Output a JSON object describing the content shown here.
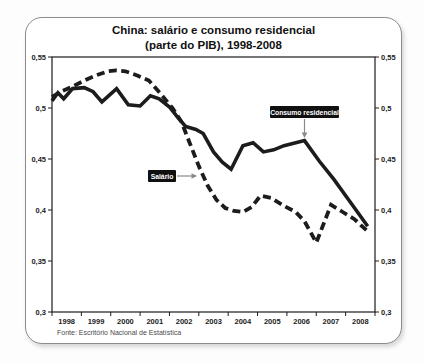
{
  "title": {
    "line1": "China: salário e consumo residencial",
    "line2": "(parte do PIB), 1998-2008"
  },
  "source": "Fonte: Escritório Nacional de Estatística",
  "colors": {
    "line": "#1c1c1c",
    "axis": "#1c1c1c",
    "annotation_bg": "#101010",
    "annotation_text": "#ffffff",
    "arrow": "#8a8a8a",
    "frame_border": "#8c8c8c",
    "background": "#ffffff"
  },
  "chart_data": {
    "type": "line",
    "title": "China: salário e consumo residencial (parte do PIB), 1998-2008",
    "xlabel": "",
    "ylabel": "",
    "x_range": [
      1998,
      2009
    ],
    "y_range": [
      0.3,
      0.55
    ],
    "grid": false,
    "legend_position": "inline-annotation-boxes",
    "y_ticks": [
      0.55,
      0.5,
      0.45,
      0.4,
      0.35,
      0.3
    ],
    "y_tick_labels": [
      "0,55",
      "0,5",
      "0,45",
      "0,4",
      "0,35",
      "0,3"
    ],
    "x_tick_labels": [
      "1998",
      "1999",
      "2000",
      "2001",
      "2002",
      "2003",
      "2004",
      "2005",
      "2006",
      "2007",
      "2008"
    ],
    "series": [
      {
        "name": "Consumo residencial",
        "style": "solid",
        "points": [
          [
            1998.0,
            0.507
          ],
          [
            1998.2,
            0.515
          ],
          [
            1998.4,
            0.509
          ],
          [
            1998.7,
            0.519
          ],
          [
            1999.1,
            0.52
          ],
          [
            1999.4,
            0.516
          ],
          [
            1999.7,
            0.506
          ],
          [
            2000.2,
            0.519
          ],
          [
            2000.6,
            0.503
          ],
          [
            2001.0,
            0.502
          ],
          [
            2001.35,
            0.512
          ],
          [
            2001.65,
            0.509
          ],
          [
            2002.0,
            0.501
          ],
          [
            2002.3,
            0.49
          ],
          [
            2002.55,
            0.482
          ],
          [
            2002.9,
            0.479
          ],
          [
            2003.15,
            0.475
          ],
          [
            2003.5,
            0.457
          ],
          [
            2003.8,
            0.447
          ],
          [
            2004.1,
            0.44
          ],
          [
            2004.5,
            0.463
          ],
          [
            2004.85,
            0.466
          ],
          [
            2005.2,
            0.457
          ],
          [
            2005.55,
            0.459
          ],
          [
            2005.9,
            0.463
          ],
          [
            2006.6,
            0.468
          ],
          [
            2007.1,
            0.448
          ],
          [
            2007.6,
            0.43
          ],
          [
            2008.1,
            0.41
          ],
          [
            2008.75,
            0.384
          ]
        ]
      },
      {
        "name": "Salário",
        "style": "dashed",
        "points": [
          [
            1998.0,
            0.511
          ],
          [
            1998.3,
            0.516
          ],
          [
            1998.7,
            0.521
          ],
          [
            1999.1,
            0.527
          ],
          [
            1999.5,
            0.532
          ],
          [
            1999.9,
            0.536
          ],
          [
            2000.2,
            0.537
          ],
          [
            2000.5,
            0.536
          ],
          [
            2000.9,
            0.532
          ],
          [
            2001.3,
            0.527
          ],
          [
            2001.7,
            0.514
          ],
          [
            2002.1,
            0.5
          ],
          [
            2002.4,
            0.487
          ],
          [
            2002.7,
            0.465
          ],
          [
            2003.0,
            0.443
          ],
          [
            2003.3,
            0.424
          ],
          [
            2003.6,
            0.41
          ],
          [
            2003.9,
            0.402
          ],
          [
            2004.2,
            0.399
          ],
          [
            2004.5,
            0.398
          ],
          [
            2004.8,
            0.403
          ],
          [
            2005.1,
            0.414
          ],
          [
            2005.45,
            0.412
          ],
          [
            2005.9,
            0.404
          ],
          [
            2006.3,
            0.398
          ],
          [
            2006.6,
            0.389
          ],
          [
            2007.0,
            0.368
          ],
          [
            2007.5,
            0.405
          ],
          [
            2007.9,
            0.398
          ],
          [
            2008.3,
            0.391
          ],
          [
            2008.75,
            0.379
          ]
        ]
      }
    ],
    "annotations": [
      {
        "text": "Consumo residencial",
        "box_px": {
          "x": 270,
          "y": 106,
          "w": 69,
          "h": 12
        },
        "arrow": {
          "x1": 304.5,
          "y1": 119,
          "x2": 304.5,
          "y2": 137,
          "dir": "down"
        }
      },
      {
        "text": "Salário",
        "box_px": {
          "x": 148,
          "y": 170,
          "w": 28,
          "h": 12
        },
        "arrow": {
          "x1": 177,
          "y1": 176,
          "x2": 196,
          "y2": 176,
          "dir": "right"
        }
      }
    ]
  }
}
